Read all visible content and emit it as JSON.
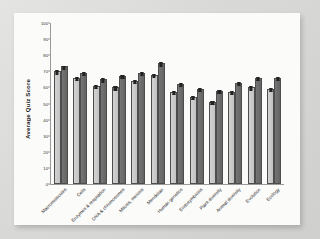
{
  "chart_data": {
    "type": "bar",
    "title": "",
    "xlabel": "",
    "ylabel": "Average Quiz Score",
    "ylim": [
      0,
      100
    ],
    "yticks": [
      0,
      10,
      20,
      30,
      40,
      50,
      60,
      70,
      80,
      90,
      100
    ],
    "grid": false,
    "legend": "none",
    "categories": [
      "Macromolecules",
      "Cells",
      "Enzymes & respiration",
      "DNA & chromosomes",
      "Mitosis, meiosis",
      "Mendelian",
      "Human genetics",
      "Endosymbiosis",
      "Plant diversity",
      "Animal diversity",
      "Evolution",
      "Ecology"
    ],
    "series": [
      {
        "name": "Group 1",
        "color": "#c8c8c8",
        "values": [
          70,
          66,
          61,
          60,
          64,
          68,
          57,
          54,
          51,
          57,
          60,
          59
        ],
        "errors": [
          1.2,
          1.2,
          1.2,
          1.2,
          1.2,
          1.2,
          1.2,
          1.2,
          1.2,
          1.2,
          1.2,
          1.2
        ]
      },
      {
        "name": "Group 2",
        "color": "#6b6b6b",
        "values": [
          73,
          69,
          65,
          67,
          69,
          75,
          62,
          59,
          58,
          63,
          66,
          66
        ],
        "errors": [
          1.2,
          1.2,
          1.2,
          1.2,
          1.2,
          1.2,
          1.2,
          1.2,
          1.2,
          1.2,
          1.2,
          1.2
        ]
      }
    ]
  },
  "figure": {
    "background_color": "#dededc",
    "card_color": "#fbfbfa",
    "axis_color": "#9a9a9a"
  }
}
